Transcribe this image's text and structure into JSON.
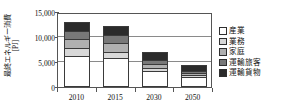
{
  "chart_data": {
    "type": "bar",
    "stacked": true,
    "title": "",
    "xlabel": "",
    "ylabel": "最終エネルギー消費 [PJ]",
    "ylabel_lines": [
      "最終エネルギー消費",
      "[PJ]"
    ],
    "categories": [
      "2010",
      "2015",
      "2030",
      "2050"
    ],
    "ylim": [
      0,
      15000
    ],
    "yticks": [
      0,
      5000,
      10000,
      15000
    ],
    "ytick_labels": [
      "0",
      "5,000",
      "10,000",
      "15,000"
    ],
    "grid": true,
    "legend_position": "right",
    "series": [
      {
        "name": "産業",
        "color": "#ffffff",
        "values": [
          6200,
          5800,
          3200,
          2100
        ]
      },
      {
        "name": "業務",
        "color": "#d8d8d8",
        "values": [
          1600,
          1300,
          700,
          400
        ]
      },
      {
        "name": "家庭",
        "color": "#b0b0b0",
        "values": [
          1800,
          1700,
          800,
          400
        ]
      },
      {
        "name": "運輸旅客",
        "color": "#787878",
        "values": [
          1700,
          1600,
          800,
          400
        ]
      },
      {
        "name": "運輸貨物",
        "color": "#2b2b2b",
        "values": [
          1700,
          1800,
          1500,
          1200
        ]
      }
    ],
    "totals": [
      13000,
      12200,
      7000,
      4500
    ]
  },
  "legend": {
    "items": [
      {
        "label": "産業",
        "color": "#ffffff"
      },
      {
        "label": "業務",
        "color": "#d8d8d8"
      },
      {
        "label": "家庭",
        "color": "#b0b0b0"
      },
      {
        "label": "運輸旅客",
        "color": "#787878"
      },
      {
        "label": "運輸貨物",
        "color": "#2b2b2b"
      }
    ]
  },
  "axis": {
    "y_title_main": "最終エネルギー消費",
    "y_title_unit": "[PJ]",
    "y_labels": [
      "15,000",
      "10,000",
      "5,000",
      "0"
    ],
    "x_labels": [
      "2010",
      "2015",
      "2030",
      "2050"
    ]
  },
  "colors": {
    "axis": "#555555",
    "grid": "#8a8a8a",
    "text": "#111111",
    "background": "#ffffff"
  }
}
